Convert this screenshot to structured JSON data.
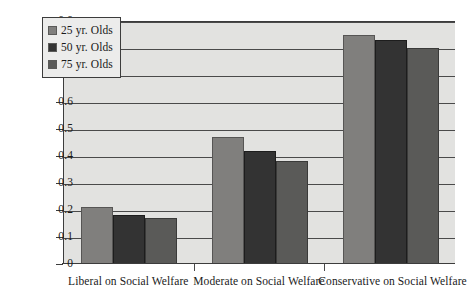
{
  "chart_data": {
    "type": "bar",
    "title": "",
    "xlabel": "",
    "ylabel": "",
    "categories": [
      "Liberal on Social Welfare",
      "Moderate on Social Welfare",
      "Conservative on Social Welfare"
    ],
    "series": [
      {
        "name": "25 yr. Olds",
        "color": "#807f7d",
        "values": [
          0.21,
          0.47,
          0.85
        ]
      },
      {
        "name": "50 yr. Olds",
        "color": "#333333",
        "values": [
          0.18,
          0.42,
          0.83
        ]
      },
      {
        "name": "75 yr. Olds",
        "color": "#5a5a58",
        "values": [
          0.17,
          0.38,
          0.8
        ]
      }
    ],
    "ylim": [
      0,
      0.9
    ],
    "ytick_labels": [
      "0.9",
      "0.8",
      "0.7",
      "0.6",
      "0.5",
      "0.4",
      "0.3",
      "0.2",
      "0.1",
      "0"
    ],
    "ytick_values": [
      0.9,
      0.8,
      0.7,
      0.6,
      0.5,
      0.4,
      0.3,
      0.2,
      0.1,
      0
    ],
    "grid": true,
    "legend_position": "top-left",
    "plot_background": "#e2e2e0",
    "axis_color": "#3c3c3c"
  },
  "legend": {
    "items": [
      {
        "label": "25 yr. Olds"
      },
      {
        "label": "50 yr. Olds"
      },
      {
        "label": "75 yr. Olds"
      }
    ]
  }
}
